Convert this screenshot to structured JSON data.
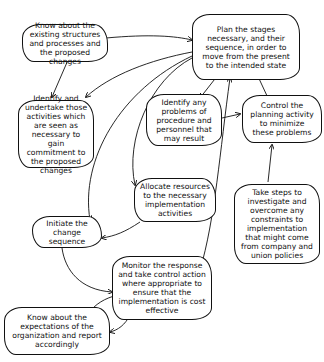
{
  "diagram": {
    "type": "flow",
    "nodes": [
      {
        "id": "plan",
        "text": "Plan the stages necessary, and their sequence, in order to move from the present to the intended state"
      },
      {
        "id": "know_existing",
        "text": "Know about the existing structures and processes and the proposed changes"
      },
      {
        "id": "identify_activities",
        "text": "Identify and undertake those activities which are seen as necessary to gain commitment to the proposed changes"
      },
      {
        "id": "identify_problems",
        "text": "Identify any problems of procedure and personnel that may result"
      },
      {
        "id": "control_planning",
        "text": "Control the planning activity to minimize these problems"
      },
      {
        "id": "allocate",
        "text": "Allocate resources to the necessary implementation activities"
      },
      {
        "id": "initiate",
        "text": "Initiate the change sequence"
      },
      {
        "id": "take_steps",
        "text": "Take steps to investigate and overcome any constraints to implementation that might come from company and union policies"
      },
      {
        "id": "monitor",
        "text": "Monitor the response and take control action where appropriate to ensure that the implementation is cost effective"
      },
      {
        "id": "know_expectations",
        "text": "Know about the expectations of the organization and report accordingly"
      }
    ],
    "edges": [
      {
        "from": "know_existing",
        "to": "plan"
      },
      {
        "from": "know_existing",
        "to": "identify_activities"
      },
      {
        "from": "plan",
        "to": "identify_activities"
      },
      {
        "from": "plan",
        "to": "identify_problems"
      },
      {
        "from": "plan",
        "to": "allocate"
      },
      {
        "from": "plan",
        "to": "initiate"
      },
      {
        "from": "identify_problems",
        "to": "control_planning"
      },
      {
        "from": "control_planning",
        "to": "plan"
      },
      {
        "from": "take_steps",
        "to": "control_planning"
      },
      {
        "from": "allocate",
        "to": "initiate"
      },
      {
        "from": "initiate",
        "to": "monitor"
      },
      {
        "from": "monitor",
        "to": "plan"
      },
      {
        "from": "monitor",
        "to": "know_expectations"
      },
      {
        "from": "know_expectations",
        "to": "monitor"
      }
    ]
  }
}
